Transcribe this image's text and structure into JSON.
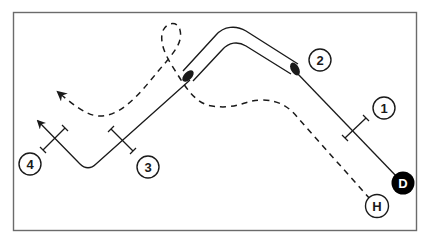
{
  "diagram": {
    "type": "route-diagram",
    "colors": {
      "frame": "#6b6b6b",
      "line": "#1a1a1a",
      "background": "#ffffff",
      "marker_D_fill": "#000000",
      "marker_D_text": "#ffffff"
    },
    "markers": {
      "D": {
        "label": "D",
        "style": "filled"
      },
      "H": {
        "label": "H",
        "style": "outline"
      }
    },
    "callouts": [
      {
        "id": "1",
        "label": "1"
      },
      {
        "id": "2",
        "label": "2"
      },
      {
        "id": "3",
        "label": "3"
      },
      {
        "id": "4",
        "label": "4"
      }
    ],
    "paths": {
      "solid_route": {
        "style": "solid",
        "from": "D",
        "direction": "arrow-end"
      },
      "dashed_route": {
        "style": "dashed",
        "from": "H",
        "direction": "arrow-end"
      },
      "tube_segment": {
        "style": "double-outline-tube"
      }
    }
  }
}
